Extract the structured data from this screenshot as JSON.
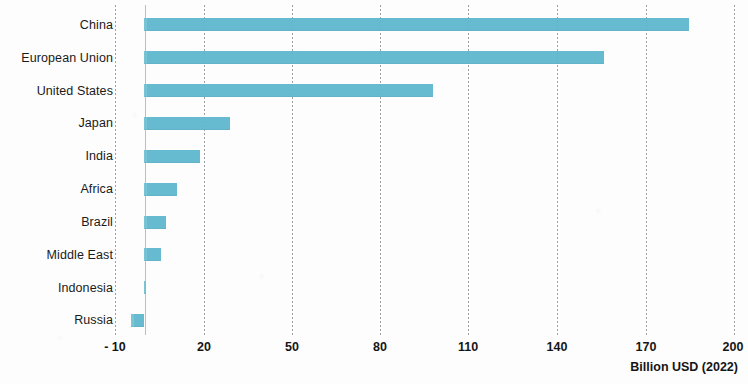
{
  "chart_data": {
    "type": "bar",
    "orientation": "horizontal",
    "title": "",
    "xlabel": "Billion USD (2022)",
    "ylabel": "",
    "categories": [
      "China",
      "European Union",
      "United States",
      "Japan",
      "India",
      "Africa",
      "Brazil",
      "Middle East",
      "Indonesia",
      "Russia"
    ],
    "values": [
      185,
      156,
      98,
      29,
      19,
      11,
      7.5,
      5.5,
      0.7,
      -4.5
    ],
    "xticks": [
      "- 10",
      "20",
      "50",
      "80",
      "110",
      "140",
      "170",
      "200"
    ],
    "xtick_values": [
      -10,
      20,
      50,
      80,
      110,
      140,
      170,
      200
    ],
    "xlim": [
      -10,
      200
    ],
    "grid": true,
    "legend": false,
    "bar_color": "#5cb7cd",
    "gridline_color": "#9aa0a4",
    "baseline_color": "#b9c0c4",
    "text_color": "#1a1a1a"
  }
}
